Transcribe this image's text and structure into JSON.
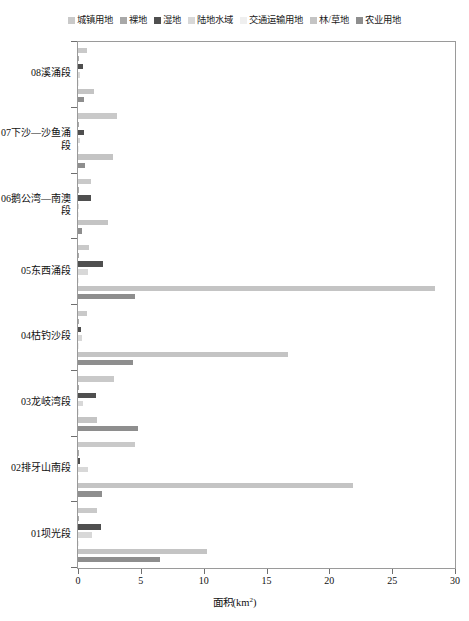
{
  "chart_data": {
    "type": "bar",
    "orientation": "horizontal",
    "title": "",
    "xlabel": "面积(km²)",
    "ylabel": "",
    "xlim": [
      0,
      30
    ],
    "xticks": [
      0,
      5,
      10,
      15,
      20,
      25,
      30
    ],
    "xtick_labels": [
      "0",
      "5",
      "10",
      "15",
      "20",
      "25",
      "30"
    ],
    "grid": false,
    "legend_position": "top-center",
    "categories": [
      "08溪涌段",
      "07下沙—沙鱼涌段",
      "06鹅公湾—南澳段",
      "05东西涌段",
      "04枯钓沙段",
      "03龙岐湾段",
      "02排牙山南段",
      "01坝光段"
    ],
    "series": [
      {
        "name": "城镇用地",
        "color": "#c9c9c9",
        "values": [
          0.7,
          3.1,
          1.0,
          0.85,
          0.75,
          2.9,
          4.5,
          1.5
        ]
      },
      {
        "name": "裸地",
        "color": "#a8a8a8",
        "values": [
          0.02,
          0.04,
          0.03,
          0.04,
          0.03,
          0.05,
          0.1,
          0.05
        ]
      },
      {
        "name": "湿地",
        "color": "#4f4f4f",
        "values": [
          0.42,
          0.45,
          1.05,
          2.0,
          0.22,
          1.4,
          0.12,
          1.8
        ]
      },
      {
        "name": "陆地水域",
        "color": "#d8d8d8",
        "values": [
          0.12,
          0.16,
          0.06,
          0.8,
          0.3,
          0.4,
          0.8,
          1.1
        ]
      },
      {
        "name": "交通运输用地",
        "color": "#efefef",
        "values": [
          0.02,
          0.03,
          0.02,
          0.04,
          0.03,
          0.04,
          0.05,
          0.04
        ]
      },
      {
        "name": "林/草地",
        "color": "#c4c4c4",
        "values": [
          1.3,
          2.8,
          2.4,
          28.4,
          16.7,
          1.5,
          21.9,
          10.3
        ]
      },
      {
        "name": "农业用地",
        "color": "#8e8e8e",
        "values": [
          0.5,
          0.52,
          0.3,
          4.5,
          4.4,
          4.8,
          1.9,
          6.5
        ]
      }
    ]
  },
  "legend": {
    "items": [
      {
        "label": "城镇用地",
        "color": "#c9c9c9"
      },
      {
        "label": "裸地",
        "color": "#a8a8a8"
      },
      {
        "label": "湿地",
        "color": "#4f4f4f"
      },
      {
        "label": "陆地水域",
        "color": "#d8d8d8"
      },
      {
        "label": "交通运输用地",
        "color": "#efefef"
      },
      {
        "label": "林/草地",
        "color": "#c4c4c4"
      },
      {
        "label": "农业用地",
        "color": "#8e8e8e"
      }
    ]
  },
  "axis": {
    "x_title_main": "面积(km",
    "x_title_sup": "2",
    "x_title_tail": ")"
  }
}
